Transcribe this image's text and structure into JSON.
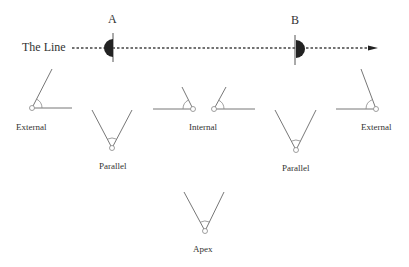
{
  "diagram": {
    "line_label": "The Line",
    "point_a": {
      "label": "A"
    },
    "point_b": {
      "label": "B"
    },
    "angle_types": [
      {
        "id": "external-left",
        "label": "External"
      },
      {
        "id": "parallel-left",
        "label": "Parallel"
      },
      {
        "id": "internal",
        "label": "Internal"
      },
      {
        "id": "parallel-right",
        "label": "Parallel"
      },
      {
        "id": "external-right",
        "label": "External"
      },
      {
        "id": "apex",
        "label": "Apex"
      }
    ],
    "colors": {
      "ink": "#333333",
      "marker_fill": "#222222",
      "line_gray": "#777777"
    }
  }
}
